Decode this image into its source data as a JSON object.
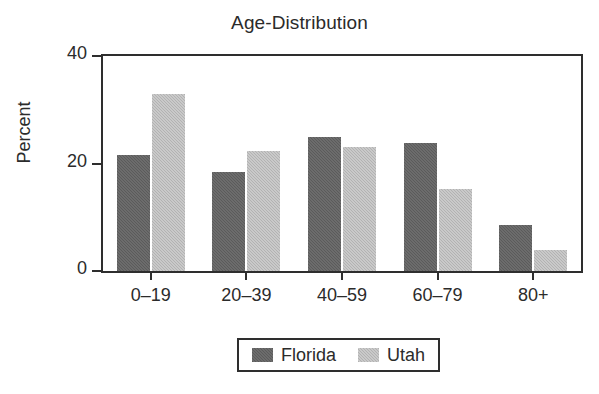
{
  "chart_data": {
    "type": "bar",
    "title": "Age-Distribution",
    "xlabel": "",
    "ylabel": "Percent",
    "categories": [
      "0–19",
      "20–39",
      "40–59",
      "60–79",
      "80+"
    ],
    "series": [
      {
        "name": "Florida",
        "color": "#5b5b5b",
        "values": [
          21.5,
          18.5,
          25.0,
          23.8,
          8.5
        ]
      },
      {
        "name": "Utah",
        "color": "#b2b2b2",
        "values": [
          33.0,
          22.3,
          23.0,
          15.3,
          4.0
        ]
      }
    ],
    "ylim": [
      0,
      40
    ],
    "yticks": [
      0,
      20,
      40
    ],
    "ytick_labels": [
      "0",
      "20",
      "40"
    ],
    "grid": false,
    "legend_position": "bottom-center",
    "frame_color": "#2e2e2e",
    "background": "#ffffff"
  },
  "legend": {
    "entries": [
      {
        "label": "Florida",
        "swatch": "legend-swatch-florida"
      },
      {
        "label": "Utah",
        "swatch": "legend-swatch-utah"
      }
    ]
  }
}
